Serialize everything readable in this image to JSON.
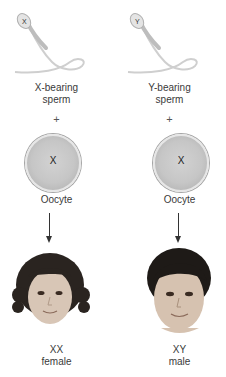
{
  "columns": [
    {
      "sperm": {
        "label_line1": "X-bearing",
        "label_line2": "sperm",
        "chromosome": "X"
      },
      "plus": "+",
      "oocyte": {
        "chromosome": "X",
        "label": "Oocyte"
      },
      "offspring": {
        "karyotype": "XX",
        "sex": "female",
        "hair": "curly"
      }
    },
    {
      "sperm": {
        "label_line1": "Y-bearing",
        "label_line2": "sperm",
        "chromosome": "Y"
      },
      "plus": "+",
      "oocyte": {
        "chromosome": "X",
        "label": "Oocyte"
      },
      "offspring": {
        "karyotype": "XY",
        "sex": "male",
        "hair": "short"
      }
    }
  ],
  "colors": {
    "oocyte_fill": "#c6c6c6",
    "text": "#3a3a3a",
    "arrow": "#333333"
  }
}
